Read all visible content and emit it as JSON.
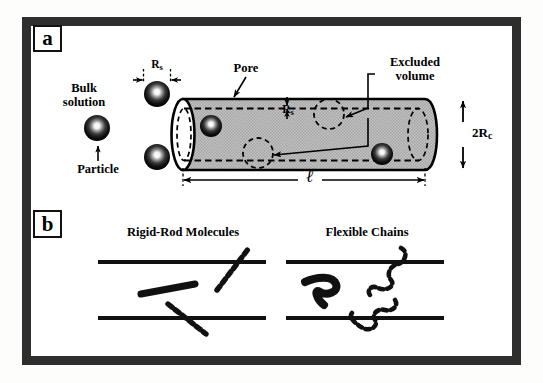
{
  "figure": {
    "panels": [
      {
        "tag": "a",
        "caption_absent": ""
      },
      {
        "tag": "b",
        "caption_absent": ""
      }
    ]
  },
  "panel_a": {
    "labels": {
      "bulk_solution_line1": "Bulk",
      "bulk_solution_line2": "solution",
      "particle": "Particle",
      "pore": "Pore",
      "excluded_volume_line1": "Excluded",
      "excluded_volume_line2": "volume",
      "solute_radius_outside": "R",
      "solute_radius_outside_sub": "s",
      "solute_radius_inside": "R",
      "solute_radius_inside_sub": "s",
      "cylinder_diameter": "2R",
      "cylinder_diameter_sub": "c",
      "pore_length": "ℓ"
    },
    "colors": {
      "frame": "#2e2e2e",
      "cylinder_fill": "#b9b9b9",
      "outline": "#000000",
      "particle": "#121212"
    },
    "particles_outside": [
      {
        "name": "particle-bulk-upper",
        "cx": 157,
        "cy": 94,
        "r": 13
      },
      {
        "name": "particle-bulk-left",
        "cx": 97,
        "cy": 128,
        "r": 13
      },
      {
        "name": "particle-bulk-lower",
        "cx": 157,
        "cy": 157,
        "r": 13
      }
    ],
    "particles_inside": [
      {
        "name": "particle-in-pore-left",
        "cx": 211,
        "cy": 126,
        "r": 11
      },
      {
        "name": "particle-in-pore-right",
        "cx": 382,
        "cy": 154,
        "r": 11
      }
    ],
    "excluded_volume_spheres": [
      {
        "name": "excluded-volume-sphere-upper",
        "cx": 329,
        "cy": 114,
        "r": 15
      },
      {
        "name": "excluded-volume-sphere-lower",
        "cx": 258,
        "cy": 153,
        "r": 15
      }
    ]
  },
  "panel_b": {
    "labels": {
      "rigid_rod_title": "Rigid-Rod Molecules",
      "flexible_chain_title": "Flexible Chains"
    },
    "colors": {
      "wall": "#111111",
      "solute": "#111111"
    }
  }
}
